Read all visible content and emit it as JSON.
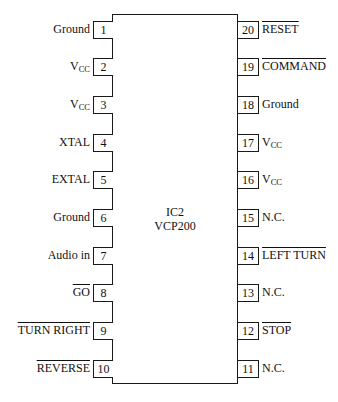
{
  "chip": {
    "designator": "IC2",
    "part_number": "VCP200"
  },
  "pins_left": [
    {
      "number": "1",
      "label": "Ground",
      "active_low": false
    },
    {
      "number": "2",
      "label": "V",
      "sub": "CC",
      "active_low": false
    },
    {
      "number": "3",
      "label": "V",
      "sub": "CC",
      "active_low": false
    },
    {
      "number": "4",
      "label": "XTAL",
      "active_low": false
    },
    {
      "number": "5",
      "label": "EXTAL",
      "active_low": false
    },
    {
      "number": "6",
      "label": "Ground",
      "active_low": false
    },
    {
      "number": "7",
      "label": "Audio in",
      "active_low": false
    },
    {
      "number": "8",
      "label": "GO",
      "active_low": true
    },
    {
      "number": "9",
      "label": "TURN RIGHT",
      "active_low": true
    },
    {
      "number": "10",
      "label": "REVERSE",
      "active_low": true
    }
  ],
  "pins_right": [
    {
      "number": "20",
      "label": "RESET",
      "active_low": true
    },
    {
      "number": "19",
      "label": "COMMAND",
      "active_low": true
    },
    {
      "number": "18",
      "label": "Ground",
      "active_low": false
    },
    {
      "number": "17",
      "label": "V",
      "sub": "CC",
      "active_low": false
    },
    {
      "number": "16",
      "label": "V",
      "sub": "CC",
      "active_low": false
    },
    {
      "number": "15",
      "label": "N.C.",
      "active_low": false
    },
    {
      "number": "14",
      "label": "LEFT TURN",
      "active_low": true
    },
    {
      "number": "13",
      "label": "N.C.",
      "active_low": false
    },
    {
      "number": "12",
      "label": "STOP",
      "active_low": true
    },
    {
      "number": "11",
      "label": "N.C.",
      "active_low": false
    }
  ],
  "colors": {
    "line": "#1a1a1a",
    "background": "#ffffff",
    "text": "#111111"
  }
}
